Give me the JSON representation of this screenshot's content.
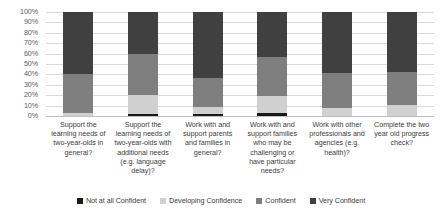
{
  "chart_data": {
    "type": "bar",
    "subtype": "stacked-100-percent",
    "title": "",
    "xlabel": "",
    "ylabel": "",
    "ylim": [
      0,
      100
    ],
    "yticks": [
      "0%",
      "10%",
      "20%",
      "30%",
      "40%",
      "50%",
      "60%",
      "70%",
      "80%",
      "90%",
      "100%"
    ],
    "grid": true,
    "legend_position": "bottom",
    "categories": [
      "Support the learning needs of two-year-olds in general?",
      "Support the learning needs of two-year-olds with additional needs (e.g. language delay)?",
      "Work with and support parents and families in general?",
      "Work with and support families who may be challenging or have particular needs?",
      "Work with other professionals and agencies (e.g. health)?",
      "Complete the two year old progress check?"
    ],
    "series": [
      {
        "name": "Not at all Confident",
        "color": "#1a1a1a",
        "values": [
          0,
          2,
          2,
          3,
          0,
          0
        ]
      },
      {
        "name": "Developing Confidence",
        "color": "#d0d0d0",
        "values": [
          3,
          18,
          7,
          16,
          8,
          11
        ]
      },
      {
        "name": "Confident",
        "color": "#7f7f7f",
        "values": [
          37,
          40,
          28,
          38,
          33,
          31
        ]
      },
      {
        "name": "Very Confident",
        "color": "#404040",
        "values": [
          60,
          40,
          63,
          43,
          59,
          58
        ]
      }
    ]
  },
  "axis": {
    "y_tick_labels": [
      "100%",
      "90%",
      "80%",
      "70%",
      "60%",
      "50%",
      "40%",
      "30%",
      "20%",
      "10%",
      "0%"
    ]
  },
  "legend": {
    "items": [
      {
        "label": "Not at all Confident",
        "color": "#1a1a1a"
      },
      {
        "label": "Developing Confidence",
        "color": "#d0d0d0"
      },
      {
        "label": "Confident",
        "color": "#7f7f7f"
      },
      {
        "label": "Very Confident",
        "color": "#404040"
      }
    ]
  }
}
